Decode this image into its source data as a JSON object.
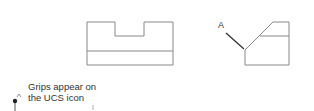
{
  "diagram": {
    "label_a": "A",
    "caption": {
      "line1": "Grips appear on",
      "line2": "the UCS icon"
    },
    "ucs_axis_label": "Y",
    "colors": {
      "line": "#888888",
      "leader": "#333333",
      "text": "#333333",
      "background": "#ffffff"
    }
  }
}
